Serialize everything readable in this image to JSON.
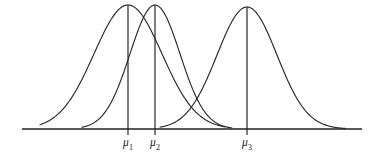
{
  "figure": {
    "type": "statistical-plot",
    "background_color": "#ffffff",
    "stroke_color": "#231f20",
    "axis_color": "#231f20",
    "label_color": "#1a1a1a"
  },
  "axis": {
    "name": "horizontal-axis",
    "y": 129,
    "x_start": 22,
    "x_end": 362,
    "stroke_width": 1.4
  },
  "ticks": [
    {
      "id": "tick-mu1",
      "x": 128,
      "y_top": 5,
      "y_bottom": 135,
      "label_text": "μ",
      "label_sub": "1",
      "label_x": 128,
      "label_y": 137
    },
    {
      "id": "tick-mu2",
      "x": 155,
      "y_top": 5,
      "y_bottom": 135,
      "label_text": "μ",
      "label_sub": "2",
      "label_x": 155,
      "label_y": 137
    },
    {
      "id": "tick-mu3",
      "x": 247,
      "y_top": 7,
      "y_bottom": 135,
      "label_text": "μ",
      "label_sub": "3",
      "label_x": 247,
      "label_y": 137
    }
  ],
  "chart_data": {
    "type": "line",
    "title": "",
    "subtitle": "",
    "xlabel": "",
    "ylabel": "",
    "grid": false,
    "legend_position": "none",
    "axis_baseline_y": 129,
    "peak_y": 5,
    "xlim": [
      22,
      362
    ],
    "ylim": [
      0,
      1
    ],
    "annotations": [
      "μ₁",
      "μ₂",
      "μ₃"
    ],
    "series": [
      {
        "name": "Normal curve 1",
        "mean": 128,
        "sigma": 34,
        "peak_x": 128,
        "peak_y": 5,
        "tail_left_x": 40,
        "tail_right_x": 225,
        "label": "μ₁"
      },
      {
        "name": "Normal curve 2",
        "mean": 155,
        "sigma": 25,
        "peak_x": 155,
        "peak_y": 5,
        "tail_left_x": 82,
        "tail_right_x": 232,
        "label": "μ₂"
      },
      {
        "name": "Normal curve 3",
        "mean": 247,
        "sigma": 30,
        "peak_x": 247,
        "peak_y": 7,
        "tail_left_x": 160,
        "tail_right_x": 345,
        "label": "μ₃"
      }
    ],
    "intersections": [
      {
        "between": [
          "Normal curve 1",
          "Normal curve 2"
        ],
        "x": 142,
        "y": 18
      },
      {
        "between": [
          "Normal curve 2",
          "Normal curve 3"
        ],
        "x": 205,
        "y": 100
      }
    ]
  }
}
